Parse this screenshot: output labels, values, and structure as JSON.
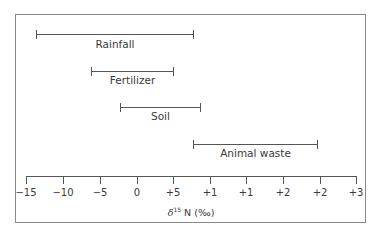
{
  "chart_data": {
    "type": "range",
    "title": "",
    "xlabel": "δ15 N (‰)",
    "xlabel_parts": {
      "delta": "δ",
      "sup": "15",
      "rest": " N (‰)"
    },
    "tick_labels": [
      "−15",
      "−10",
      "−5",
      "0",
      "+5",
      "+1",
      "+1",
      "+2",
      "+2",
      "+3"
    ],
    "grid": false,
    "series": [
      {
        "name": "Rainfall",
        "start_approx": -12.5,
        "end_approx": 9
      },
      {
        "name": "Fertilizer",
        "start_approx": -5,
        "end_approx": 6.5
      },
      {
        "name": "Soil",
        "start_approx": -2.5,
        "end_approx": 10
      },
      {
        "name": "Animal waste",
        "start_approx": 8,
        "end_approx": 25
      }
    ]
  },
  "bars": [
    {
      "label": "Rainfall",
      "x1": 36,
      "x2": 194,
      "y": 34,
      "ly": 38
    },
    {
      "label": "Fertilizer",
      "x1": 91,
      "x2": 174,
      "y": 71,
      "ly": 74
    },
    {
      "label": "Soil",
      "x1": 120,
      "x2": 201,
      "y": 107,
      "ly": 110
    },
    {
      "label": "Animal waste",
      "x1": 193,
      "x2": 318,
      "y": 144,
      "ly": 147
    }
  ],
  "ticks_x": [
    26,
    63,
    100,
    137,
    173,
    210,
    246,
    283,
    320,
    356
  ]
}
